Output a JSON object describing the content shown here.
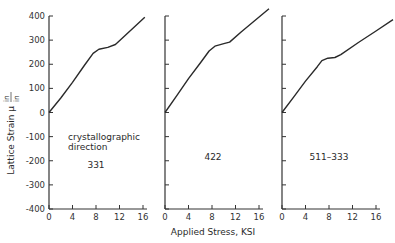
{
  "chart_data": {
    "type": "line",
    "title": "",
    "xlabel": "Applied Stress, KSI",
    "ylabel": "Lattice Strain μ in/in",
    "ylabel_parts": {
      "main": "Lattice Strain μ",
      "num": "in",
      "den": "in"
    },
    "ylim": [
      -400,
      400
    ],
    "yticks": [
      400,
      300,
      200,
      100,
      0,
      -100,
      -200,
      -300,
      -400
    ],
    "xlim": [
      0,
      16
    ],
    "xticks": [
      0,
      4,
      8,
      12,
      16
    ],
    "grid": false,
    "legend": "none",
    "annotation": {
      "line1": "crystallographic",
      "line2": "direction"
    },
    "panels": [
      {
        "name": "331",
        "label": "331",
        "x": [
          0,
          2,
          4,
          6,
          7.5,
          8.5,
          10,
          11.3,
          13,
          16.3
        ],
        "y": [
          0,
          60,
          125,
          195,
          245,
          262,
          270,
          282,
          320,
          395
        ]
      },
      {
        "name": "422",
        "label": "422",
        "x": [
          0,
          2,
          4,
          6,
          7.5,
          8.5,
          10,
          11,
          13,
          15,
          17.7
        ],
        "y": [
          0,
          70,
          140,
          205,
          255,
          275,
          285,
          292,
          335,
          375,
          430
        ]
      },
      {
        "name": "511-333",
        "label": "511–333",
        "x": [
          0,
          2,
          4,
          6,
          6.8,
          7.8,
          9,
          10,
          13,
          16,
          18.9
        ],
        "y": [
          0,
          65,
          130,
          190,
          215,
          225,
          228,
          240,
          290,
          338,
          385
        ]
      }
    ]
  }
}
